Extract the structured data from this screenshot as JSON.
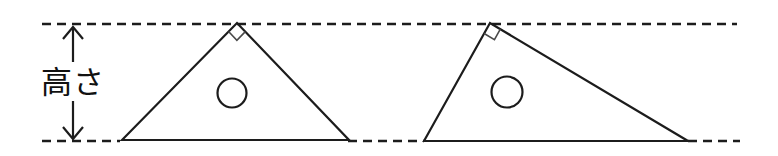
{
  "figure": {
    "label": "高さ",
    "colors": {
      "stroke": "#1c1c1c",
      "angle_mark_stroke": "#4a4a4a",
      "background": "#ffffff"
    },
    "canvas": {
      "width": 778,
      "height": 156
    },
    "guides": {
      "dash_pattern": "9 6",
      "dashed_line_width": 2.6,
      "top_line": {
        "x1": 42,
        "y1": 24,
        "x2": 737,
        "y2": 24
      },
      "bottom_segments": [
        {
          "x1": 42,
          "y1": 141,
          "x2": 120,
          "y2": 141
        },
        {
          "x1": 348,
          "y1": 141,
          "x2": 424,
          "y2": 141
        },
        {
          "x1": 688,
          "y1": 141,
          "x2": 740,
          "y2": 141
        }
      ]
    },
    "height_arrow": {
      "x": 73,
      "tip_top": 27,
      "tip_bottom": 139,
      "label_gap_top": 62,
      "label_gap_bottom": 101,
      "head_half_width": 10,
      "head_height": 12,
      "line_width": 2.2
    },
    "shape_line_width": 2.2,
    "triangles": [
      {
        "points": [
          [
            122,
            140
          ],
          [
            237,
            23
          ],
          [
            349,
            140
          ]
        ],
        "right_angle_at": 1,
        "square_size": 12,
        "circle": {
          "cx": 232,
          "cy": 93,
          "r": 14.5
        }
      },
      {
        "points": [
          [
            424,
            141
          ],
          [
            490,
            23
          ],
          [
            688,
            141
          ]
        ],
        "right_angle_at": 1,
        "square_size": 12,
        "circle": {
          "cx": 507,
          "cy": 92,
          "r": 15.5
        }
      }
    ]
  }
}
